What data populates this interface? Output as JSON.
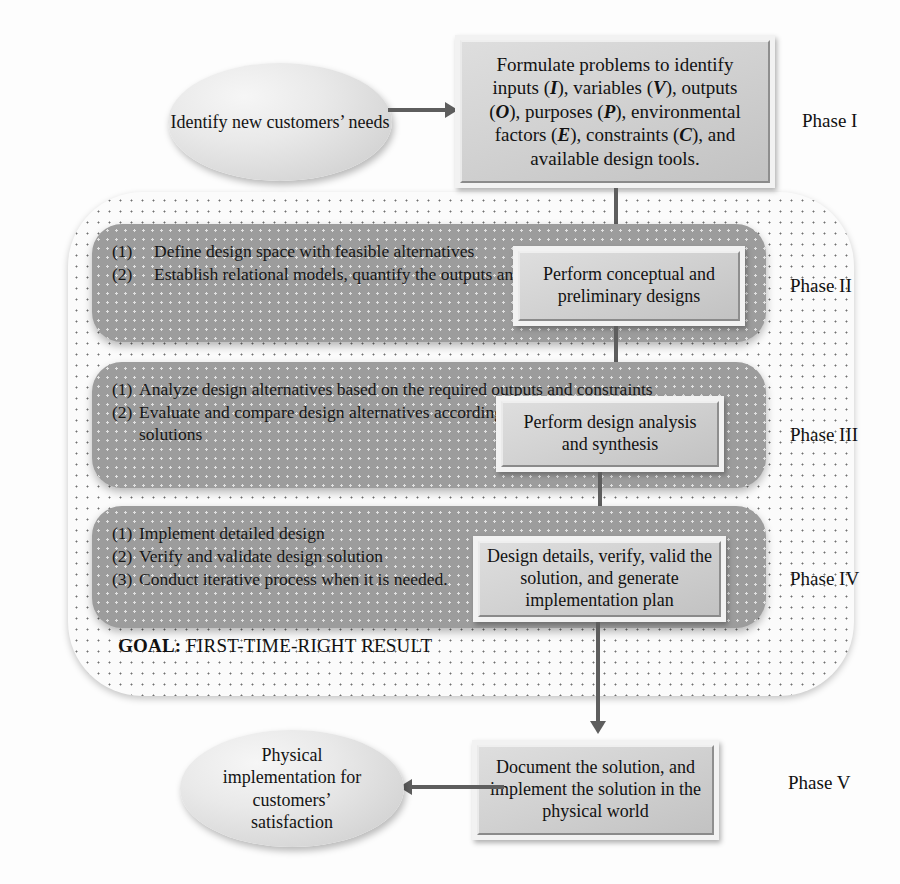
{
  "diagram": {
    "goal_text": {
      "label": "GOAL:",
      "value": "FIRST-TIME-RIGHT RESULT"
    },
    "phase_labels": {
      "p1": "Phase I",
      "p2": "Phase II",
      "p3": "Phase III",
      "p4": "Phase IV",
      "p5": "Phase V"
    },
    "ellipses": {
      "start": "Identify new customers’ needs",
      "end": "Physical implementation for customers’ satisfaction"
    },
    "process_boxes": {
      "phase1": {
        "line1": "Formulate problems to identify",
        "line2_a": "inputs (",
        "line2_i": "I",
        "line2_b": "), variables (",
        "line2_v": "V",
        "line2_c": "), outputs",
        "line3_a": "(",
        "line3_o": "O",
        "line3_b": "), purposes (",
        "line3_p": "P",
        "line3_c": "), environmental",
        "line4_a": "factors (",
        "line4_e": "E",
        "line4_b": "), constraints (",
        "line4_cc": "C",
        "line4_c": "), and",
        "line5": "available design tools."
      },
      "phase2": "Perform conceptual and preliminary designs",
      "phase3": "Perform design analysis and synthesis",
      "phase4": "Design details, verify, valid the solution, and generate implementation plan",
      "phase5": "Document the solution, and implement the solution in the physical world"
    },
    "bands": {
      "phase2_items": [
        {
          "num": "(1)",
          "text": "Define design space with feasible alternatives"
        },
        {
          "num": "(2)",
          "text": "Establish relational models, quantify the outputs and purpose"
        }
      ],
      "phase3_items": [
        {
          "num": "(1)",
          "text": "Analyze design alternatives based on the required outputs and constraints"
        },
        {
          "num": "(2)",
          "text": "Evaluate and compare design alternatives according to the purposes to optimize solutions"
        }
      ],
      "phase4_items": [
        {
          "num": "(1)",
          "text": "Implement detailed design"
        },
        {
          "num": "(2)",
          "text": "Verify and validate design solution"
        },
        {
          "num": "(3)",
          "text": "Conduct iterative process when it is needed."
        }
      ]
    },
    "colors": {
      "band_gray": "#9c9c9c",
      "box_gray": "#d2d2d2",
      "arrow_gray": "#5e5e5e",
      "page_bg": "#fdfdfd"
    }
  }
}
